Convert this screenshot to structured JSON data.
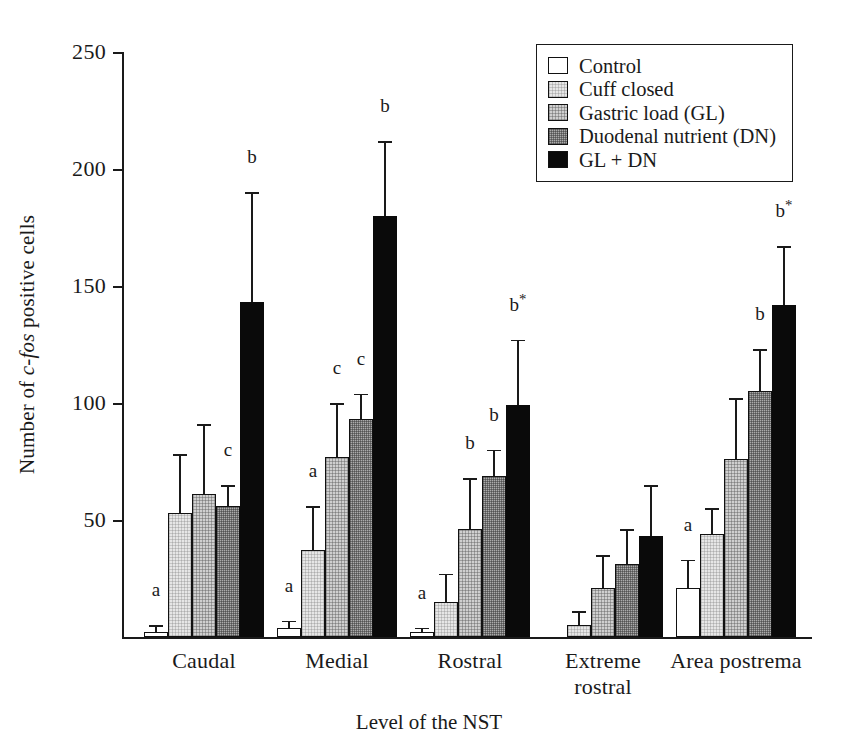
{
  "chart_data": {
    "type": "bar",
    "title": "",
    "xlabel": "Level of the NST",
    "ylabel": "Number of c-fos positive cells",
    "ylabel_parts": {
      "before": "Number of ",
      "italic": "c-fos",
      "after": " positive cells"
    },
    "ylim": [
      0,
      250
    ],
    "yticks": [
      0,
      50,
      100,
      150,
      200,
      250
    ],
    "ytick_labels": [
      "",
      "50",
      "100",
      "150",
      "200",
      "250"
    ],
    "grid": false,
    "legend_position": "top-right",
    "error_bar_type": "SEM (upper only)",
    "categories": [
      "Caudal",
      "Medial",
      "Rostral",
      "Extreme rostral",
      "Area postrema"
    ],
    "category_label_lines": [
      [
        "Caudal"
      ],
      [
        "Medial"
      ],
      [
        "Rostral"
      ],
      [
        "Extreme",
        "rostral"
      ],
      [
        "Area postrema"
      ]
    ],
    "series": [
      {
        "name": "Control",
        "fill": "white",
        "color": "#ffffff",
        "values": [
          2,
          4,
          2,
          0,
          21
        ],
        "errors": [
          3,
          3,
          2,
          0,
          12
        ],
        "annotations": [
          "a",
          "a",
          "a",
          "",
          "a"
        ]
      },
      {
        "name": "Cuff closed",
        "fill": "light",
        "color": "#e6e6e6",
        "values": [
          53,
          37,
          15,
          5,
          44
        ],
        "errors": [
          25,
          19,
          12,
          6,
          11
        ],
        "annotations": [
          "",
          "a",
          "",
          "",
          ""
        ]
      },
      {
        "name": "Gastric load (GL)",
        "fill": "med",
        "color": "#cfcfcf",
        "values": [
          61,
          77,
          46,
          21,
          76
        ],
        "errors": [
          30,
          23,
          22,
          14,
          26
        ],
        "annotations": [
          "",
          "c",
          "b",
          "",
          ""
        ]
      },
      {
        "name": "Duodenal nutrient (DN)",
        "fill": "dark",
        "color": "#ababab",
        "values": [
          56,
          93,
          69,
          31,
          105
        ],
        "errors": [
          9,
          11,
          11,
          15,
          18
        ],
        "annotations": [
          "c",
          "c",
          "b",
          "",
          "b"
        ]
      },
      {
        "name": "GL + DN",
        "fill": "black",
        "color": "#0a0a0a",
        "values": [
          143,
          180,
          99,
          43,
          142
        ],
        "errors": [
          47,
          32,
          28,
          22,
          25
        ],
        "annotations": [
          "b",
          "b",
          "b*",
          "",
          "b*"
        ]
      }
    ]
  },
  "legend": {
    "items": [
      {
        "label": "Control",
        "fill": "white"
      },
      {
        "label": "Cuff closed",
        "fill": "light"
      },
      {
        "label": "Gastric load (GL)",
        "fill": "med"
      },
      {
        "label": "Duodenal nutrient (DN)",
        "fill": "dark"
      },
      {
        "label": "GL + DN",
        "fill": "black"
      }
    ]
  }
}
